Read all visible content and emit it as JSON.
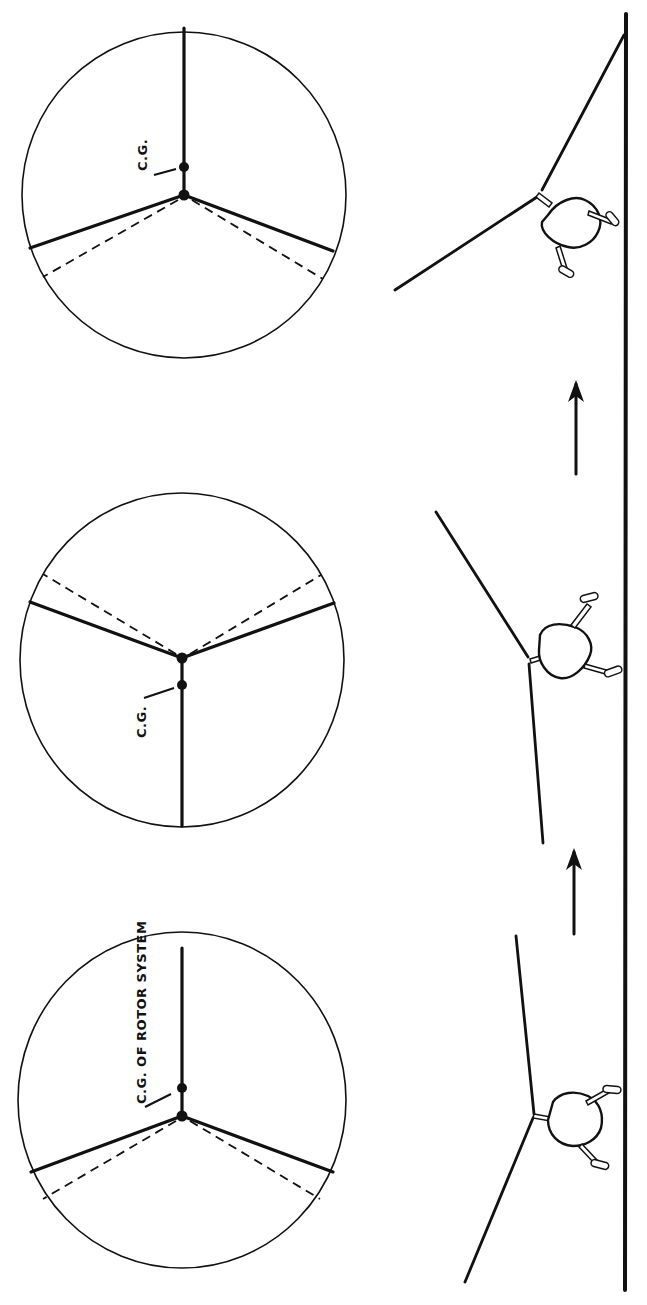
{
  "figure": {
    "labels": {
      "cg_of_rotor_system": "C.G. OF  ROTOR  SYSTEM",
      "cg_top": "C.G.",
      "cg_middle": "C.G."
    },
    "rotor_discs": [
      {
        "id": "disc-1",
        "position": "top",
        "cg_offset": "toward blade 1 (up)",
        "blade_count": 3,
        "lead_lag_shown": "dashed lines"
      },
      {
        "id": "disc-2",
        "position": "middle",
        "cg_offset": "toward blade 1 (down)",
        "blade_count": 3,
        "lead_lag_shown": "dashed lines"
      },
      {
        "id": "disc-3",
        "position": "bottom",
        "cg_offset": "toward blade 1 (up)",
        "blade_count": 3,
        "lead_lag_shown": "dashed lines"
      }
    ],
    "helicopters": [
      {
        "id": "heli-1",
        "position": "top",
        "tilt": "rolled toward rear"
      },
      {
        "id": "heli-2",
        "position": "middle",
        "tilt": "rolled forward"
      },
      {
        "id": "heli-3",
        "position": "bottom",
        "tilt": "rolled toward rear"
      }
    ],
    "arrows": [
      {
        "id": "arrow-1",
        "direction": "sequence forward"
      },
      {
        "id": "arrow-2",
        "direction": "sequence forward"
      }
    ],
    "colors": {
      "ink": "#111111",
      "paper": "#ffffff"
    }
  }
}
